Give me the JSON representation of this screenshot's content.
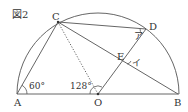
{
  "figure": {
    "title": "図2",
    "points": {
      "A": "A",
      "B": "B",
      "C": "C",
      "D": "D",
      "E": "E",
      "O": "O"
    },
    "angles": {
      "angle_A": "60°",
      "angle_COA": "128°",
      "angle_a": "ア",
      "angle_i": "イ"
    },
    "colors": {
      "stroke": "#444444",
      "text": "#333333"
    }
  }
}
